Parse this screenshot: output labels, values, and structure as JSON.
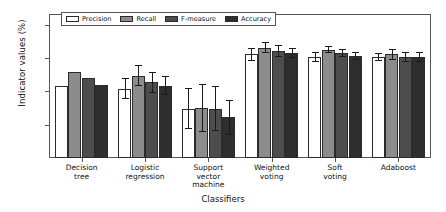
{
  "chart_data": {
    "type": "bar",
    "title": "",
    "xlabel": "Classifiers",
    "ylabel": "Indicator values (%)",
    "ylim": [
      80,
      101.5
    ],
    "yticks": [
      80,
      85,
      90,
      95,
      100
    ],
    "grid": false,
    "legend_position": "upper-left-inside",
    "categories": [
      "Decision\ntree",
      "Logistic\nregression",
      "Support\nvector\nmachine",
      "Weighted\nvoting",
      "Soft\nvoting",
      "Adaboost"
    ],
    "category_labels": [
      [
        "Decision",
        "tree"
      ],
      [
        "Logistic",
        "regression"
      ],
      [
        "Support",
        "vector",
        "machine"
      ],
      [
        "Weighted",
        "voting"
      ],
      [
        "Soft",
        "voting"
      ],
      [
        "Adaboost"
      ]
    ],
    "series": [
      {
        "name": "Precision",
        "color": "#ffffff",
        "values": [
          90.8,
          90.4,
          87.4,
          95.6,
          95.2,
          95.2
        ],
        "errors": [
          0.0,
          1.6,
          3.1,
          1.0,
          0.7,
          0.6
        ]
      },
      {
        "name": "Recall",
        "color": "#8c8c8c",
        "values": [
          93.0,
          92.4,
          87.5,
          96.6,
          96.3,
          95.6
        ],
        "errors": [
          0.0,
          1.6,
          3.6,
          0.8,
          0.5,
          0.8
        ]
      },
      {
        "name": "F-measure",
        "color": "#4d4d4d",
        "values": [
          92.0,
          91.4,
          87.4,
          96.1,
          95.8,
          95.2
        ],
        "errors": [
          0.0,
          1.6,
          3.4,
          0.9,
          0.6,
          0.7
        ]
      },
      {
        "name": "Accuracy",
        "color": "#2e2e2e",
        "values": [
          91.0,
          90.9,
          86.1,
          95.8,
          95.4,
          95.2
        ],
        "errors": [
          0.0,
          1.5,
          2.6,
          0.8,
          0.6,
          0.8
        ]
      }
    ]
  },
  "axis": {
    "ylabel": "Indicator values (%)",
    "xlabel": "Classifiers",
    "ytick_labels": [
      "80",
      "85",
      "90",
      "95",
      "100"
    ]
  },
  "legend": {
    "items": [
      {
        "label": "Precision"
      },
      {
        "label": "Recall"
      },
      {
        "label": "F-measure"
      },
      {
        "label": "Accuracy"
      }
    ]
  }
}
